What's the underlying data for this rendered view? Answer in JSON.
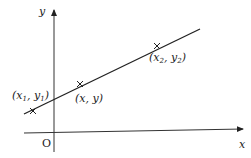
{
  "diagram": {
    "type": "coordinate-line",
    "axes": {
      "x_label": "x",
      "y_label": "y",
      "origin_label": "O"
    },
    "line": {
      "description": "straight line through three marked points",
      "color": "#222222"
    },
    "points": [
      {
        "id": "p1",
        "label": "(x",
        "sub1": "1",
        "mid": ", y",
        "sub2": "1",
        "end": ")"
      },
      {
        "id": "p",
        "label": "(x, y)"
      },
      {
        "id": "p2",
        "label": "(x",
        "sub1": "2",
        "mid": ", y",
        "sub2": "2",
        "end": ")"
      }
    ]
  }
}
